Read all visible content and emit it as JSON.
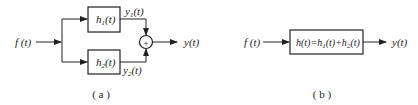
{
  "diagram_a": {
    "input_label": "f (t)",
    "block_top": {
      "base": "h",
      "sub": "1",
      "arg": "(t)"
    },
    "block_bottom": {
      "base": "h",
      "sub": "2",
      "arg": "(t)"
    },
    "top_output": {
      "base": "y",
      "sub": "1",
      "arg": "(t)"
    },
    "bottom_output": {
      "base": "y",
      "sub": "2",
      "arg": "(t)"
    },
    "summer_symbol": "+",
    "output_label": "y(t)",
    "caption": "( a )"
  },
  "diagram_b": {
    "input_label": "f (t)",
    "block": {
      "p1": "h(t)=h",
      "s1": "1",
      "p2": "(t)+h",
      "s2": "2",
      "p3": "(t)"
    },
    "output_label": "y(t)",
    "caption": "( b )"
  }
}
